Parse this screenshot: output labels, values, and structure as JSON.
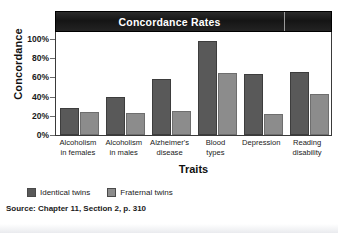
{
  "chart_data": {
    "type": "bar",
    "title": "Concordance Rates",
    "xlabel": "Traits",
    "ylabel": "Concordance",
    "ylim": [
      0,
      100
    ],
    "yticks": [
      "0%",
      "20%",
      "40%",
      "60%",
      "80%",
      "100%"
    ],
    "ytick_values": [
      0,
      20,
      40,
      60,
      80,
      100
    ],
    "grid": false,
    "legend_position": "bottom-left",
    "categories": [
      "Alcoholism in females",
      "Alcoholism in males",
      "Alzheimer's disease",
      "Blood types",
      "Depression",
      "Reading disability"
    ],
    "category_lines": [
      [
        "Alcoholism",
        "in females"
      ],
      [
        "Alcoholism",
        "in males"
      ],
      [
        "Alzheimer's",
        "disease"
      ],
      [
        "Blood",
        "types"
      ],
      [
        "Depression",
        ""
      ],
      [
        "Reading",
        "disability"
      ]
    ],
    "series": [
      {
        "name": "Identical twins",
        "color": "#595959",
        "values": [
          28,
          40,
          58,
          98,
          64,
          66
        ]
      },
      {
        "name": "Fraternal twins",
        "color": "#8c8c8c",
        "values": [
          24,
          23,
          25,
          65,
          22,
          43
        ]
      }
    ]
  },
  "source": "Source: Chapter 11, Section 2, p. 310",
  "colors": {
    "title_bar_background": "#1a1a1a",
    "title_text": "#ffffff",
    "identical": "#595959",
    "fraternal": "#8c8c8c",
    "axis": "#3a3a3a"
  }
}
